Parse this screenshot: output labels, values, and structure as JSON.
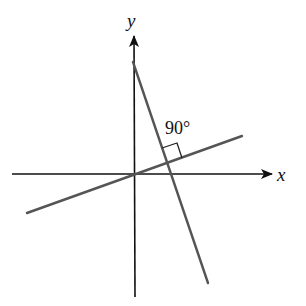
{
  "diagram": {
    "type": "coordinate-geometry",
    "axes": {
      "x_label": "x",
      "y_label": "y",
      "origin": [
        134,
        174
      ],
      "x_axis": {
        "from": [
          12,
          174
        ],
        "to": [
          272,
          174
        ]
      },
      "y_axis": {
        "from": [
          135,
          297
        ],
        "to": [
          134,
          36
        ]
      }
    },
    "lines": [
      {
        "name": "line-through-origin",
        "from": [
          27,
          213
        ],
        "to": [
          242,
          136
        ],
        "color": "#555555"
      },
      {
        "name": "steep-line",
        "from": [
          133,
          62
        ],
        "to": [
          208,
          283
        ],
        "color": "#555555"
      }
    ],
    "right_angle": {
      "label": "90°",
      "label_position": [
        166,
        134
      ],
      "marker": [
        [
          162,
          148
        ],
        [
          177,
          143
        ],
        [
          182,
          158
        ]
      ],
      "intersection": [
        167,
        162
      ]
    },
    "colors": {
      "axis": "#111111",
      "line": "#555555",
      "background": "#ffffff"
    }
  }
}
